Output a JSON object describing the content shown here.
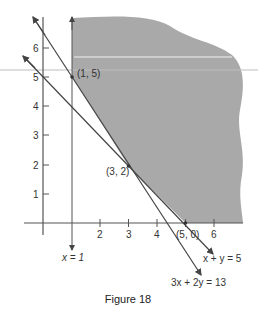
{
  "figure": {
    "caption": "Figure 18",
    "colors": {
      "feasible_region": "#a9a9a9",
      "axis": "#555555",
      "line": "#444444",
      "text": "#333333"
    },
    "axes": {
      "x_ticks": [
        {
          "value": 2,
          "label": "2"
        },
        {
          "value": 3,
          "label": "3"
        },
        {
          "value": 4,
          "label": "4"
        },
        {
          "value": 6,
          "label": "6"
        }
      ],
      "y_ticks": [
        {
          "value": 1,
          "label": "1"
        },
        {
          "value": 2,
          "label": "2"
        },
        {
          "value": 3,
          "label": "3"
        },
        {
          "value": 4,
          "label": "4"
        },
        {
          "value": 5,
          "label": "5"
        },
        {
          "value": 6,
          "label": "6"
        }
      ]
    },
    "lines": [
      {
        "equation": "x = 1",
        "label": "x = 1"
      },
      {
        "equation": "x + y = 5",
        "label": "x + y = 5"
      },
      {
        "equation": "3x + 2y = 13",
        "label": "3x + 2y = 13"
      }
    ],
    "points": [
      {
        "x": 1,
        "y": 5,
        "label": "(1, 5)"
      },
      {
        "x": 3,
        "y": 2,
        "label": "(3, 2)"
      },
      {
        "x": 5,
        "y": 0,
        "label": "(5, 0)"
      }
    ],
    "region": {
      "description": "Unbounded feasible region (shaded) to the right of x = 1 and above 3x + 2y = 13 and x + y = 5"
    }
  }
}
